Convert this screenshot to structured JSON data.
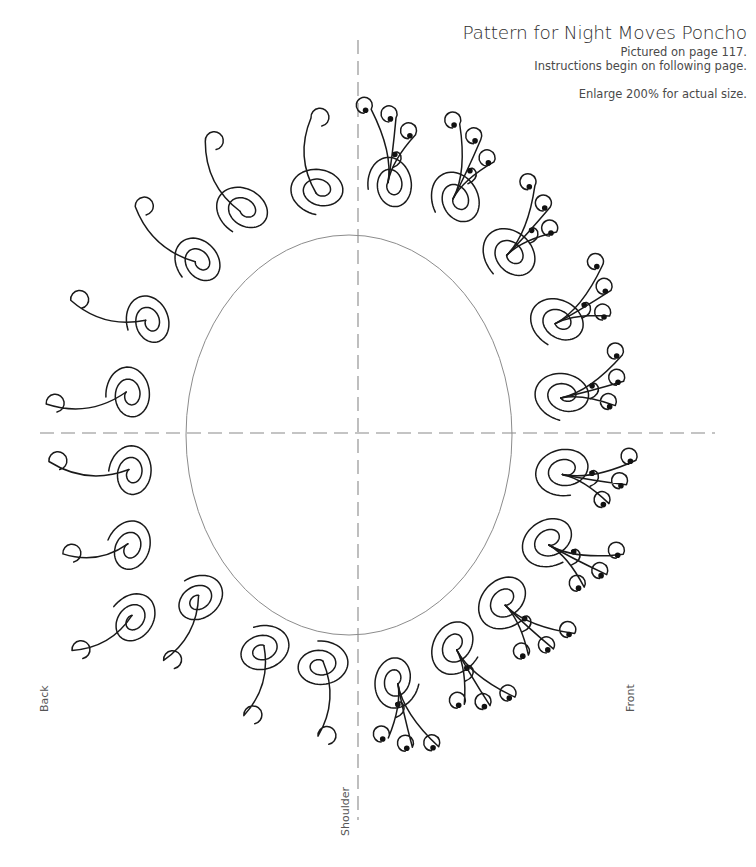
{
  "header": {
    "title": "Pattern for Night Moves Poncho",
    "pictured": "Pictured on page 117.",
    "instructions": "Instructions begin on following page.",
    "enlarge": "Enlarge 200% for actual size."
  },
  "labels": {
    "back": "Back",
    "front": "Front",
    "shoulder": "Shoulder"
  },
  "colors": {
    "ink": "#1a1a1a",
    "guide": "#8a8a8a",
    "neckline": "#8c8c8c",
    "text": "#3a3a3a"
  },
  "diagram": {
    "neckline": {
      "cx": 349,
      "cy": 435,
      "rx": 163,
      "ry": 200
    },
    "center_line_vertical": {
      "x": 358,
      "y1": 40,
      "y2": 820
    },
    "center_line_horizontal": {
      "y": 433,
      "x1": 40,
      "x2": 715
    },
    "back_swirls": [
      {
        "x": 133,
        "y": 620,
        "angle": 215,
        "r": 30,
        "tail": [
          -60,
          35
        ]
      },
      {
        "x": 198,
        "y": 600,
        "angle": 235,
        "r": 30,
        "tail": [
          -35,
          65
        ]
      },
      {
        "x": 262,
        "y": 650,
        "angle": 250,
        "r": 31,
        "tail": [
          -20,
          70
        ]
      },
      {
        "x": 320,
        "y": 665,
        "angle": 265,
        "r": 31,
        "tail": [
          -5,
          75
        ]
      },
      {
        "x": 130,
        "y": 548,
        "angle": 200,
        "r": 30,
        "tail": [
          -65,
          10
        ]
      },
      {
        "x": 132,
        "y": 473,
        "angle": 185,
        "r": 30,
        "tail": [
          -80,
          -8
        ]
      },
      {
        "x": 130,
        "y": 395,
        "angle": 175,
        "r": 31,
        "tail": [
          -80,
          12
        ]
      },
      {
        "x": 150,
        "y": 322,
        "angle": 160,
        "r": 30,
        "tail": [
          -75,
          -20
        ]
      },
      {
        "x": 200,
        "y": 262,
        "angle": 140,
        "r": 30,
        "tail": [
          -60,
          -55
        ]
      },
      {
        "x": 245,
        "y": 210,
        "angle": 120,
        "r": 32,
        "tail": [
          -35,
          -70
        ]
      },
      {
        "x": 320,
        "y": 190,
        "angle": 100,
        "r": 32,
        "tail": [
          -5,
          -75
        ]
      }
    ],
    "front_swirls": [
      {
        "x": 392,
        "y": 185,
        "angle": 80,
        "r": 31
      },
      {
        "x": 458,
        "y": 200,
        "angle": 62,
        "r": 33
      },
      {
        "x": 512,
        "y": 255,
        "angle": 45,
        "r": 34
      },
      {
        "x": 560,
        "y": 322,
        "angle": 28,
        "r": 33
      },
      {
        "x": 565,
        "y": 395,
        "angle": 12,
        "r": 33
      },
      {
        "x": 565,
        "y": 470,
        "angle": -12,
        "r": 33
      },
      {
        "x": 550,
        "y": 540,
        "angle": -30,
        "r": 33
      },
      {
        "x": 505,
        "y": 600,
        "angle": -45,
        "r": 34
      },
      {
        "x": 455,
        "y": 645,
        "angle": -62,
        "r": 33
      },
      {
        "x": 395,
        "y": 680,
        "angle": -80,
        "r": 31
      }
    ]
  }
}
